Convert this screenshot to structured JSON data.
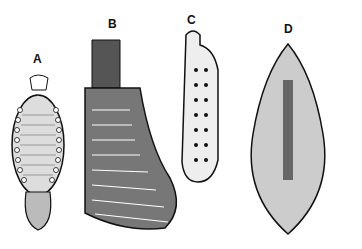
{
  "figure": {
    "panels": [
      {
        "label": "A",
        "x": 33,
        "y": 52
      },
      {
        "label": "B",
        "x": 108,
        "y": 17
      },
      {
        "label": "C",
        "x": 187,
        "y": 13
      },
      {
        "label": "D",
        "x": 284,
        "y": 22
      }
    ],
    "colors": {
      "ink": "#111111",
      "paper": "#ffffff",
      "shade": "#555555",
      "light": "#cfcfcf"
    }
  }
}
